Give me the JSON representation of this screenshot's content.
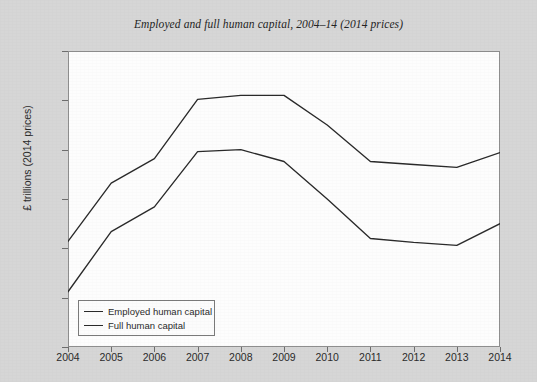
{
  "chart_data": {
    "type": "line",
    "title": "Employed and full human capital, 2004–14 (2014 prices)",
    "xlabel": "",
    "ylabel": "£ trillions (2014 prices)",
    "x": [
      2004,
      2005,
      2006,
      2007,
      2008,
      2009,
      2010,
      2011,
      2012,
      2013,
      2014
    ],
    "xtick_labels": [
      "2004",
      "2005",
      "2006",
      "2007",
      "2008",
      "2009",
      "2010",
      "2011",
      "2012",
      "2013",
      "2014"
    ],
    "ytick_labels": [
      "17.0",
      "17.5",
      "18.0",
      "18.5",
      "19.0",
      "19.5",
      "20.0"
    ],
    "ytick_values": [
      17.0,
      17.5,
      18.0,
      18.5,
      19.0,
      19.5,
      20.0
    ],
    "xlim": [
      2004,
      2014
    ],
    "ylim": [
      17.0,
      20.0
    ],
    "grid": false,
    "legend_position": "bottom-left",
    "series": [
      {
        "name": "Employed human capital",
        "color": "#2a2a2a",
        "values": [
          17.56,
          18.17,
          18.42,
          18.98,
          19.0,
          18.88,
          18.5,
          18.1,
          18.06,
          18.03,
          18.25
        ]
      },
      {
        "name": "Full human capital",
        "color": "#2a2a2a",
        "values": [
          18.07,
          18.66,
          18.91,
          19.51,
          19.55,
          19.55,
          19.25,
          18.88,
          18.85,
          18.82,
          18.97
        ]
      }
    ]
  },
  "caption": ""
}
